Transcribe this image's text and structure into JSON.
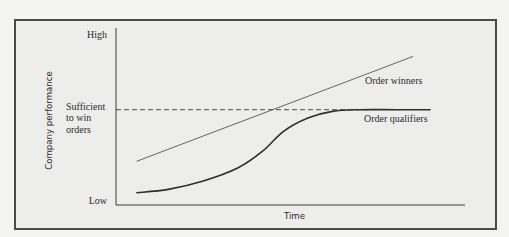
{
  "chart_data": {
    "type": "line",
    "title": "",
    "xlabel": "Time",
    "ylabel": "Company performance",
    "xlim": [
      0,
      1
    ],
    "ylim": [
      0,
      1
    ],
    "y_ticks": [
      {
        "value": 1.0,
        "label": "High"
      },
      {
        "value": 0.55,
        "label": "Sufficient to win orders",
        "lines": [
          "Sufficient",
          "to win",
          "orders"
        ]
      },
      {
        "value": 0.0,
        "label": "Low"
      }
    ],
    "grid": false,
    "legend": "none (inline labels at right)",
    "reference_lines": [
      {
        "name": "Sufficient to win orders",
        "y": 0.55,
        "style": "dashed"
      }
    ],
    "series": [
      {
        "name": "Order winners",
        "style": "solid-thin",
        "label_position": "right, below line end",
        "x": [
          0.06,
          0.85
        ],
        "y": [
          0.24,
          0.87
        ]
      },
      {
        "name": "Order qualifiers",
        "style": "solid-thick",
        "label_position": "right, below plateau",
        "x": [
          0.06,
          0.15,
          0.25,
          0.35,
          0.42,
          0.48,
          0.55,
          0.62,
          0.7,
          0.8,
          0.9
        ],
        "y": [
          0.05,
          0.07,
          0.12,
          0.2,
          0.3,
          0.42,
          0.5,
          0.54,
          0.55,
          0.55,
          0.55
        ]
      }
    ]
  }
}
